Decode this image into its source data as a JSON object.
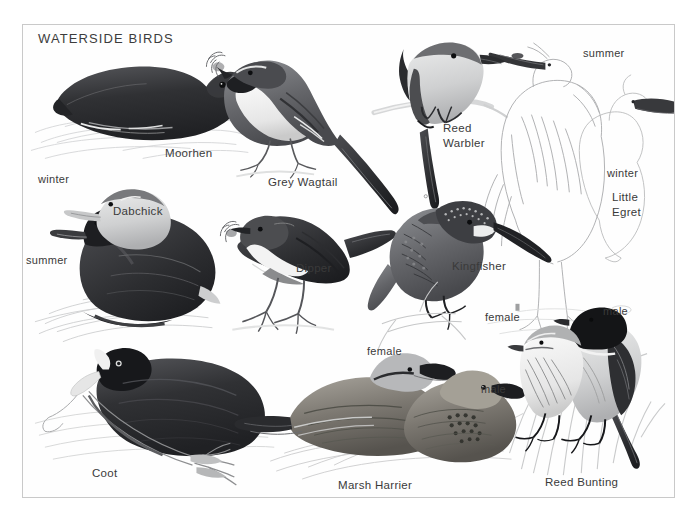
{
  "plate": {
    "title": "WATERSIDE BIRDS",
    "frame_color": "#c9c9c9",
    "background_color": "#ffffff",
    "text_color": "#3a3a3a"
  },
  "species": [
    {
      "name": "Moorhen",
      "label": "Moorhen",
      "label_x": 165,
      "label_y": 146,
      "annotations": []
    },
    {
      "name": "Grey Wagtail",
      "label": "Grey Wagtail",
      "label_x": 268,
      "label_y": 175,
      "annotations": []
    },
    {
      "name": "Reed Warbler",
      "label": "Reed\nWarbler",
      "label_line1": "Reed",
      "label_line2": "Warbler",
      "label_x": 443,
      "label_y": 121,
      "annotations": []
    },
    {
      "name": "Little Egret",
      "label_line1": "Little",
      "label_line2": "Egret",
      "label_x": 612,
      "label_y": 190,
      "annotations": [
        {
          "text": "summer",
          "x": 583,
          "y": 47
        },
        {
          "text": "winter",
          "x": 607,
          "y": 167
        }
      ]
    },
    {
      "name": "Dabchick",
      "label": "Dabchick",
      "label_x": 113,
      "label_y": 205,
      "annotations": [
        {
          "text": "winter",
          "x": 38,
          "y": 173
        },
        {
          "text": "summer",
          "x": 26,
          "y": 255
        }
      ]
    },
    {
      "name": "Dipper",
      "label": "Dipper",
      "label_x": 296,
      "label_y": 261,
      "annotations": []
    },
    {
      "name": "Kingfisher",
      "label": "Kingfisher",
      "label_x": 452,
      "label_y": 259,
      "annotations": []
    },
    {
      "name": "Coot",
      "label": "Coot",
      "label_x": 92,
      "label_y": 466,
      "annotations": []
    },
    {
      "name": "Marsh Harrier",
      "label": "Marsh Harrier",
      "label_x": 338,
      "label_y": 478,
      "annotations": [
        {
          "text": "female",
          "x": 367,
          "y": 345
        },
        {
          "text": "male",
          "x": 481,
          "y": 383
        }
      ]
    },
    {
      "name": "Reed Bunting",
      "label": "Reed Bunting",
      "label_x": 545,
      "label_y": 475,
      "annotations": [
        {
          "text": "female",
          "x": 485,
          "y": 311
        },
        {
          "text": "male",
          "x": 603,
          "y": 305
        }
      ]
    }
  ],
  "labels": {
    "moorhen": "Moorhen",
    "grey_wagtail": "Grey Wagtail",
    "reed_warbler_l1": "Reed",
    "reed_warbler_l2": "Warbler",
    "little_egret_l1": "Little",
    "little_egret_l2": "Egret",
    "egret_summer": "summer",
    "egret_winter": "winter",
    "dabchick": "Dabchick",
    "dabchick_winter": "winter",
    "dabchick_summer": "summer",
    "dipper": "Dipper",
    "kingfisher": "Kingfisher",
    "coot": "Coot",
    "marsh_harrier": "Marsh Harrier",
    "harrier_female": "female",
    "harrier_male": "male",
    "reed_bunting": "Reed Bunting",
    "bunting_female": "female",
    "bunting_male": "male"
  }
}
